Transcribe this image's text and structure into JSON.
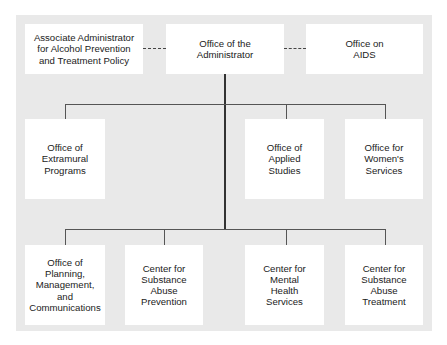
{
  "chart": {
    "type": "org-chart",
    "top_row": {
      "left": {
        "label": "Associate Administrator\nfor Alcohol Prevention\nand Treatment Policy"
      },
      "center": {
        "label": "Office of the\nAdministrator"
      },
      "right": {
        "label": "Office on\nAIDS"
      }
    },
    "middle_row": [
      {
        "label": "Office of\nExtramural\nPrograms"
      },
      {
        "label": "Office of\nApplied\nStudies"
      },
      {
        "label": "Office for\nWomen's\nServices"
      }
    ],
    "bottom_row": [
      {
        "label": "Office of\nPlanning,\nManagement,\nand\nCommunications"
      },
      {
        "label": "Center for\nSubstance\nAbuse\nPrevention"
      },
      {
        "label": "Center for\nMental\nHealth\nServices"
      },
      {
        "label": "Center for\nSubstance\nAbuse\nTreatment"
      }
    ],
    "connectors": {
      "dashed": [
        "top_row.left-center",
        "top_row.center-right"
      ],
      "solid": [
        "center-to-middle_row",
        "center-to-bottom_row"
      ]
    },
    "colors": {
      "panel": "#e9e9e9",
      "box": "#ffffff",
      "text": "#222222",
      "line": "#555555"
    }
  }
}
